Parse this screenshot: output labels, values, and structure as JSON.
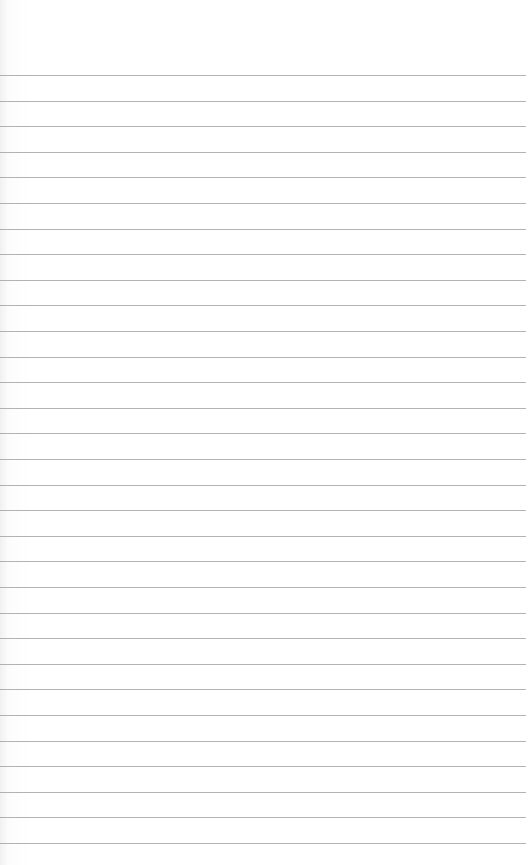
{
  "paper": {
    "type": "lined-paper",
    "background_color": "#ffffff",
    "line_color": "#9a9a9a",
    "line_count": 31,
    "first_line_y": 75,
    "line_spacing": 25.6,
    "top_bleed_text": "",
    "bottom_bleed_text": ""
  }
}
